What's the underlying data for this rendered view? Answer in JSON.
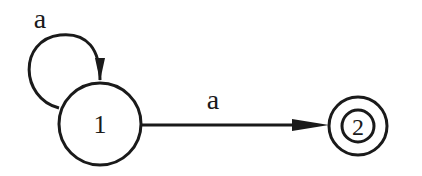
{
  "diagram": {
    "type": "finite-automaton",
    "states": [
      {
        "id": "1",
        "label": "1",
        "accepting": false
      },
      {
        "id": "2",
        "label": "2",
        "accepting": true
      }
    ],
    "transitions": [
      {
        "from": "1",
        "to": "1",
        "label": "a",
        "kind": "self-loop"
      },
      {
        "from": "1",
        "to": "2",
        "label": "a",
        "kind": "edge"
      }
    ],
    "colors": {
      "stroke": "#1a1a1a",
      "background": "#ffffff"
    }
  }
}
